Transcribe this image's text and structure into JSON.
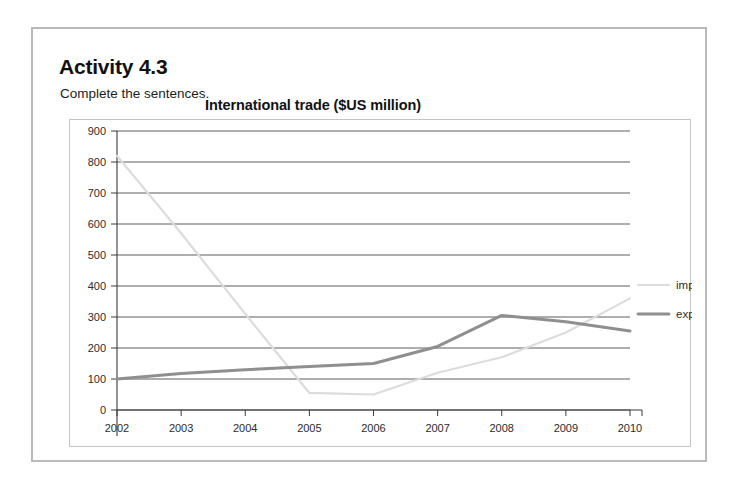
{
  "activity": {
    "heading": "Activity 4.3",
    "instruction": "Complete the sentences."
  },
  "chart_data": {
    "type": "line",
    "title": "International trade ($US million)",
    "xlabel": "",
    "ylabel": "",
    "categories": [
      "2002",
      "2003",
      "2004",
      "2005",
      "2006",
      "2007",
      "2008",
      "2009",
      "2010"
    ],
    "x": [
      2002,
      2003,
      2004,
      2005,
      2006,
      2007,
      2008,
      2009,
      2010
    ],
    "ylim": [
      0,
      900
    ],
    "ytick_labels": [
      "0",
      "100",
      "200",
      "300",
      "400",
      "500",
      "600",
      "700",
      "800",
      "900"
    ],
    "yticks": [
      0,
      100,
      200,
      300,
      400,
      500,
      600,
      700,
      800,
      900
    ],
    "grid": true,
    "legend_position": "right",
    "series": [
      {
        "name": "imports",
        "color": "#dcdcdc",
        "width": 2.2,
        "values": [
          820,
          570,
          310,
          55,
          50,
          120,
          170,
          250,
          360
        ]
      },
      {
        "name": "exports",
        "color": "#8f8f8f",
        "width": 3.0,
        "values": [
          100,
          118,
          130,
          140,
          150,
          205,
          305,
          285,
          255
        ]
      }
    ]
  },
  "legend": {
    "items": [
      {
        "label": "imports",
        "color": "#dcdcdc"
      },
      {
        "label": "exports",
        "color": "#8f8f8f"
      }
    ]
  },
  "colors": {
    "page_background": "#ffffff",
    "activity_border": "#b9b9b9",
    "chart_border": "#c4c4c4",
    "gridline": "#4a4a4a",
    "axis": "#3a3a3a",
    "text": "#1a1a1a"
  }
}
